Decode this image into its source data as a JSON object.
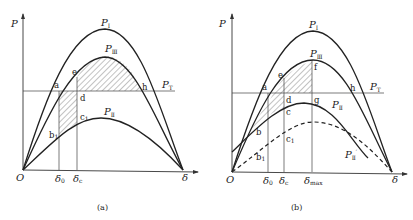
{
  "panels": [
    {
      "id": "a",
      "caption": "(a)",
      "axis_y_label": "P",
      "axis_x_label": "δ",
      "origin_label": "O",
      "curves": {
        "PI": "P",
        "PI_sub": "I",
        "PIII": "P",
        "PIII_sub": "Ⅲ",
        "PII": "P",
        "PII_sub": "Ⅱ",
        "PT": "P",
        "PT_sub": "T"
      },
      "points": {
        "a": "a",
        "e": "e",
        "d": "d",
        "c1": "c",
        "c1_sub": "1",
        "b1": "b",
        "b1_sub": "1",
        "h": "h"
      },
      "ticks": {
        "d0": "δ",
        "d0_sub": "0",
        "dc": "δ",
        "dc_sub": "c"
      }
    },
    {
      "id": "b",
      "caption": "(b)",
      "axis_y_label": "P",
      "axis_x_label": "δ",
      "origin_label": "O",
      "curves": {
        "PI": "P",
        "PI_sub": "I",
        "PIII": "P",
        "PIII_sub": "Ⅲ",
        "PII": "P",
        "PII_sub": "Ⅱ",
        "PIIp": "P",
        "PIIp_sub": "Ⅱ",
        "PIIp_prime": "′",
        "PT": "P",
        "PT_sub": "T"
      },
      "points": {
        "a": "a",
        "e": "e",
        "f": "f",
        "d": "d",
        "g": "g",
        "c": "c",
        "c1": "c",
        "c1_sub": "1",
        "b": "b",
        "b1": "b",
        "b1_sub": "1",
        "h": "h"
      },
      "ticks": {
        "d0": "δ",
        "d0_sub": "0",
        "dc": "δ",
        "dc_sub": "c",
        "dmax": "δ",
        "dmax_sub": "max"
      }
    }
  ]
}
